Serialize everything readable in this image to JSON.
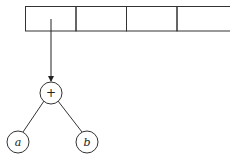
{
  "diagram": {
    "array": {
      "cells": [
        "",
        "",
        "",
        ""
      ]
    },
    "tree": {
      "root": {
        "label": "+"
      },
      "left": {
        "label": "a"
      },
      "right": {
        "label": "b"
      }
    }
  }
}
